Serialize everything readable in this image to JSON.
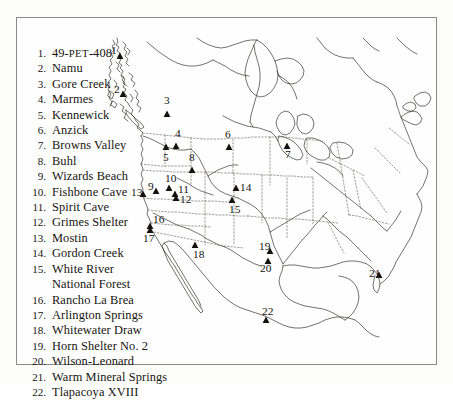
{
  "figure": {
    "border_color": "#8a8a8a",
    "background_color": "#fefefe",
    "ink_color": "#14120e"
  },
  "legend": {
    "items": [
      {
        "number": "1.",
        "name": "49-PET-408",
        "smallcaps_part": "PET",
        "prefix": "49-",
        "suffix": "-408"
      },
      {
        "number": "2.",
        "name": "Namu"
      },
      {
        "number": "3.",
        "name": "Gore Creek"
      },
      {
        "number": "4.",
        "name": "Marmes"
      },
      {
        "number": "5.",
        "name": "Kennewick"
      },
      {
        "number": "6.",
        "name": "Anzick"
      },
      {
        "number": "7.",
        "name": "Browns Valley"
      },
      {
        "number": "8.",
        "name": "Buhl"
      },
      {
        "number": "9.",
        "name": "Wizards Beach"
      },
      {
        "number": "10.",
        "name": "Fishbone Cave"
      },
      {
        "number": "11.",
        "name": "Spirit Cave"
      },
      {
        "number": "12.",
        "name": "Grimes Shelter"
      },
      {
        "number": "13.",
        "name": "Mostin"
      },
      {
        "number": "14.",
        "name": "Gordon Creek"
      },
      {
        "number": "15.",
        "name": "White River",
        "continuation": "National Forest"
      },
      {
        "number": "16.",
        "name": "Rancho La Brea"
      },
      {
        "number": "17.",
        "name": "Arlington Springs"
      },
      {
        "number": "18.",
        "name": "Whitewater Draw"
      },
      {
        "number": "19.",
        "name": "Horn Shelter No. 2"
      },
      {
        "number": "20.",
        "name": "Wilson-Leonard"
      },
      {
        "number": "21.",
        "name": "Warm Mineral Springs"
      },
      {
        "number": "22.",
        "name": "Tlapacoya XVIII"
      }
    ]
  },
  "map": {
    "markers": [
      {
        "id": "1",
        "label": "1",
        "x": 103,
        "y": 38,
        "label_x": 94,
        "label_y": 36
      },
      {
        "id": "2",
        "label": "2",
        "x": 106,
        "y": 76,
        "label_x": 97,
        "label_y": 75
      },
      {
        "id": "3",
        "label": "3",
        "x": 150,
        "y": 96,
        "label_x": 147,
        "label_y": 86
      },
      {
        "id": "4",
        "label": "4",
        "x": 159,
        "y": 128,
        "label_x": 158,
        "label_y": 119
      },
      {
        "id": "5",
        "label": "5",
        "x": 149,
        "y": 129,
        "label_x": 146,
        "label_y": 143
      },
      {
        "id": "6",
        "label": "6",
        "x": 212,
        "y": 129,
        "label_x": 208,
        "label_y": 120
      },
      {
        "id": "7",
        "label": "7",
        "x": 270,
        "y": 128,
        "label_x": 268,
        "label_y": 140
      },
      {
        "id": "8",
        "label": "8",
        "x": 175,
        "y": 152,
        "label_x": 172,
        "label_y": 143
      },
      {
        "id": "9",
        "label": "9",
        "x": 139,
        "y": 173,
        "label_x": 131,
        "label_y": 172
      },
      {
        "id": "10",
        "label": "10",
        "x": 152,
        "y": 170,
        "label_x": 148,
        "label_y": 164
      },
      {
        "id": "11",
        "label": "11",
        "x": 158,
        "y": 176,
        "label_x": 161,
        "label_y": 175
      },
      {
        "id": "12",
        "label": "12",
        "x": 159,
        "y": 180,
        "label_x": 163,
        "label_y": 185
      },
      {
        "id": "13",
        "label": "13",
        "x": 126,
        "y": 176,
        "label_x": 114,
        "label_y": 178
      },
      {
        "id": "14",
        "label": "14",
        "x": 219,
        "y": 170,
        "label_x": 223,
        "label_y": 173
      },
      {
        "id": "15",
        "label": "15",
        "x": 215,
        "y": 182,
        "label_x": 212,
        "label_y": 195
      },
      {
        "id": "16",
        "label": "16",
        "x": 133,
        "y": 208,
        "label_x": 136,
        "label_y": 205
      },
      {
        "id": "17",
        "label": "17",
        "x": 133,
        "y": 212,
        "label_x": 126,
        "label_y": 224
      },
      {
        "id": "18",
        "label": "18",
        "x": 178,
        "y": 227,
        "label_x": 176,
        "label_y": 240
      },
      {
        "id": "19",
        "label": "19",
        "x": 253,
        "y": 233,
        "label_x": 242,
        "label_y": 232
      },
      {
        "id": "20",
        "label": "20",
        "x": 251,
        "y": 243,
        "label_x": 243,
        "label_y": 254
      },
      {
        "id": "21",
        "label": "21",
        "x": 362,
        "y": 257,
        "label_x": 352,
        "label_y": 259
      },
      {
        "id": "22",
        "label": "22",
        "x": 249,
        "y": 302,
        "label_x": 245,
        "label_y": 297
      }
    ]
  }
}
